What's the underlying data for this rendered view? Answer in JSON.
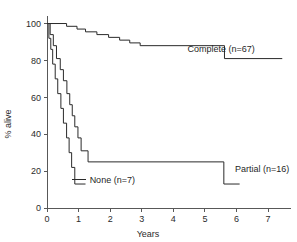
{
  "chart_data": {
    "type": "line",
    "subtype": "kaplan-meier-step",
    "title": "",
    "xlabel": "Years",
    "ylabel": "% alive",
    "xlim": [
      0,
      7.6
    ],
    "ylim": [
      0,
      103
    ],
    "grid": false,
    "legend_position": "inline-annotation",
    "x_ticks": [
      0,
      1,
      2,
      3,
      4,
      5,
      6,
      7
    ],
    "x_tick_labels": [
      "0",
      "1",
      "2",
      "3",
      "4",
      "5",
      "6",
      "7"
    ],
    "y_ticks": [
      0,
      20,
      40,
      60,
      80,
      100
    ],
    "y_tick_labels": [
      "0",
      "20",
      "40",
      "60",
      "80",
      "100"
    ],
    "series": [
      {
        "name": "Complete (n=67)",
        "label": "Complete (n=67)",
        "n": 67,
        "color": "#2a2a2a",
        "label_x": 4.45,
        "label_y": 86.5,
        "points": [
          [
            0.0,
            100
          ],
          [
            0.62,
            100
          ],
          [
            0.62,
            98.5
          ],
          [
            0.95,
            98.5
          ],
          [
            0.95,
            97.0
          ],
          [
            1.22,
            97.0
          ],
          [
            1.22,
            95.5
          ],
          [
            1.58,
            95.5
          ],
          [
            1.58,
            94.0
          ],
          [
            1.95,
            94.0
          ],
          [
            1.95,
            92.5
          ],
          [
            2.3,
            92.5
          ],
          [
            2.3,
            91.0
          ],
          [
            2.62,
            91.0
          ],
          [
            2.62,
            89.5
          ],
          [
            2.95,
            89.5
          ],
          [
            2.95,
            88.0
          ],
          [
            5.62,
            88.0
          ],
          [
            5.62,
            81.0
          ],
          [
            7.45,
            81.0
          ]
        ]
      },
      {
        "name": "Partial (n=16)",
        "label": "Partial (n=16)",
        "n": 16,
        "color": "#2a2a2a",
        "label_x": 5.95,
        "label_y": 21.0,
        "points": [
          [
            0.0,
            100
          ],
          [
            0.1,
            100
          ],
          [
            0.1,
            94
          ],
          [
            0.2,
            94
          ],
          [
            0.2,
            88
          ],
          [
            0.3,
            88
          ],
          [
            0.3,
            81
          ],
          [
            0.42,
            81
          ],
          [
            0.42,
            75
          ],
          [
            0.52,
            75
          ],
          [
            0.52,
            69
          ],
          [
            0.63,
            69
          ],
          [
            0.63,
            62
          ],
          [
            0.72,
            62
          ],
          [
            0.72,
            56
          ],
          [
            0.8,
            56
          ],
          [
            0.8,
            50
          ],
          [
            0.88,
            50
          ],
          [
            0.88,
            44
          ],
          [
            0.98,
            44
          ],
          [
            0.98,
            38
          ],
          [
            1.08,
            38
          ],
          [
            1.08,
            31
          ],
          [
            1.3,
            31
          ],
          [
            1.3,
            25
          ],
          [
            5.6,
            25
          ],
          [
            5.6,
            13
          ],
          [
            6.1,
            13
          ]
        ]
      },
      {
        "name": "None (n=7)",
        "label": "None (n=7)",
        "n": 7,
        "color": "#2a2a2a",
        "label_x": 1.35,
        "label_y": 15.5,
        "points": [
          [
            0.0,
            100
          ],
          [
            0.06,
            100
          ],
          [
            0.06,
            92
          ],
          [
            0.12,
            92
          ],
          [
            0.12,
            86
          ],
          [
            0.18,
            86
          ],
          [
            0.18,
            78
          ],
          [
            0.26,
            78
          ],
          [
            0.26,
            70
          ],
          [
            0.34,
            70
          ],
          [
            0.34,
            62
          ],
          [
            0.44,
            62
          ],
          [
            0.44,
            54
          ],
          [
            0.52,
            54
          ],
          [
            0.52,
            46
          ],
          [
            0.62,
            46
          ],
          [
            0.62,
            38
          ],
          [
            0.7,
            38
          ],
          [
            0.7,
            30
          ],
          [
            0.78,
            30
          ],
          [
            0.78,
            22
          ],
          [
            0.88,
            22
          ],
          [
            0.88,
            13
          ],
          [
            1.22,
            13
          ]
        ]
      }
    ]
  }
}
